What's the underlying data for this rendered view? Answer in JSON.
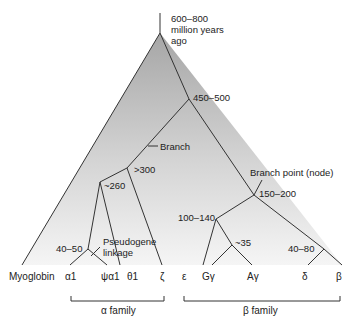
{
  "diagram": {
    "type": "phylogenetic-tree",
    "root_label": [
      "600–800",
      "million years",
      "ago"
    ],
    "node_labels": {
      "n450": "450–500",
      "branch": "Branch",
      "n300": ">300",
      "n260": "~260",
      "n4050": "40–50",
      "pseudogene": [
        "Pseudogene",
        "linkage"
      ],
      "branch_point": "Branch point (node)",
      "n150": "150–200",
      "n100": "100–140",
      "n35": "~35",
      "n4080": "40–80"
    },
    "leaves": [
      "Myoglobin",
      "α1",
      "ψα1",
      "θ1",
      "ζ",
      "ε",
      "Gγ",
      "Aγ",
      "δ",
      "β"
    ],
    "families": {
      "alpha": "α family",
      "beta": "β family"
    },
    "colors": {
      "line": "#333333",
      "fill_top": "#a8a8a8",
      "fill_bottom": "#f2f2f2"
    }
  }
}
